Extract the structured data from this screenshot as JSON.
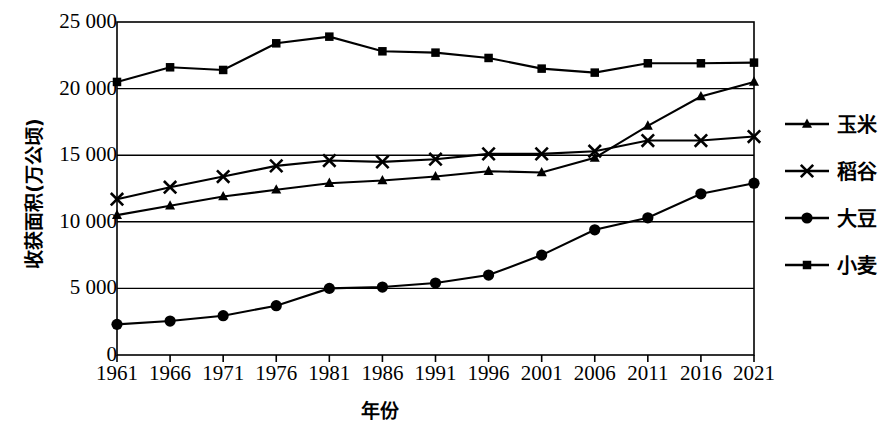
{
  "chart_data": {
    "type": "line",
    "title": "",
    "xlabel": "年份",
    "ylabel": "收获面积(万公顷)",
    "x": [
      1961,
      1966,
      1971,
      1976,
      1981,
      1986,
      1991,
      1996,
      2001,
      2006,
      2011,
      2016,
      2021
    ],
    "categories": [
      "1961",
      "1966",
      "1971",
      "1976",
      "1981",
      "1986",
      "1991",
      "1996",
      "2001",
      "2006",
      "2011",
      "2016",
      "2021"
    ],
    "xtick_labels": [
      "1961",
      "1966",
      "1971",
      "1976",
      "1981",
      "1986",
      "1991",
      "1996",
      "2001",
      "2006",
      "2011",
      "2016",
      "2021"
    ],
    "ytick_labels": [
      "25 000",
      "20 000",
      "15 000",
      "10 000",
      "5 000",
      "0"
    ],
    "ytick_values": [
      25000,
      20000,
      15000,
      10000,
      5000,
      0
    ],
    "ylim": [
      0,
      25000
    ],
    "grid": "horizontal",
    "legend_position": "right",
    "series": [
      {
        "name": "玉米",
        "marker": "triangle",
        "color": "#000000",
        "values": [
          10500,
          11200,
          11900,
          12400,
          12900,
          13100,
          13400,
          13800,
          13700,
          14800,
          17200,
          19400,
          20500
        ]
      },
      {
        "name": "稻谷",
        "marker": "x",
        "color": "#000000",
        "values": [
          11700,
          12600,
          13400,
          14200,
          14600,
          14500,
          14700,
          15100,
          15100,
          15300,
          16100,
          16100,
          16400
        ]
      },
      {
        "name": "大豆",
        "marker": "circle",
        "color": "#000000",
        "values": [
          2300,
          2550,
          2950,
          3700,
          5000,
          5100,
          5400,
          6000,
          7500,
          9400,
          10300,
          12100,
          12900
        ]
      },
      {
        "name": "小麦",
        "marker": "square",
        "color": "#000000",
        "values": [
          20500,
          21600,
          21400,
          23400,
          23900,
          22800,
          22700,
          22300,
          21500,
          21200,
          21900,
          21900,
          21950
        ]
      }
    ]
  },
  "legend": {
    "items": [
      {
        "label": "玉米",
        "marker": "triangle"
      },
      {
        "label": "稻谷",
        "marker": "x"
      },
      {
        "label": "大豆",
        "marker": "circle"
      },
      {
        "label": "小麦",
        "marker": "square"
      }
    ]
  },
  "axes": {
    "y_title": "收获面积(万公顷)",
    "x_title": "年份"
  }
}
